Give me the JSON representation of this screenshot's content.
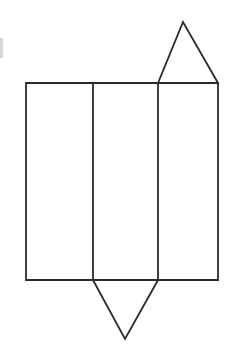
{
  "figure": {
    "title": "Net of a triangular prism",
    "type": "line-drawing",
    "background_color": "#ffffff",
    "stroke_color": "#2a2a2a",
    "stroke_width": 1.8,
    "canvas": {
      "width": 233,
      "height": 359
    },
    "parts": {
      "body_rectangle": {
        "name": "prism lateral faces rectangle",
        "x": 26,
        "y": 83,
        "width": 192,
        "height": 197,
        "points": "26,83 218,83 218,280 26,280"
      },
      "divider_left": {
        "name": "fold line between face 1 and face 2",
        "x": 93,
        "y1": 83,
        "y2": 280
      },
      "divider_right": {
        "name": "fold line between face 2 and face 3",
        "x": 158,
        "y1": 83,
        "y2": 280
      },
      "top_triangle": {
        "name": "upper triangular base flap",
        "apex_x": 183,
        "apex_y": 22,
        "base_left_x": 158,
        "base_right_x": 218,
        "base_y": 83,
        "points": "158,83 183,22 218,83"
      },
      "bottom_triangle": {
        "name": "lower triangular base flap",
        "apex_x": 125,
        "apex_y": 339,
        "base_left_x": 93,
        "base_right_x": 158,
        "base_y": 280,
        "points": "93,280 125,339 158,280"
      },
      "left_edge_artifact": {
        "name": "scan artifact at left margin",
        "x": 0,
        "y": 38,
        "width": 3,
        "height": 20
      }
    },
    "panels": [
      {
        "label": "face-1",
        "x": 26,
        "width": 67
      },
      {
        "label": "face-2",
        "x": 93,
        "width": 65
      },
      {
        "label": "face-3",
        "x": 158,
        "width": 60
      }
    ]
  }
}
